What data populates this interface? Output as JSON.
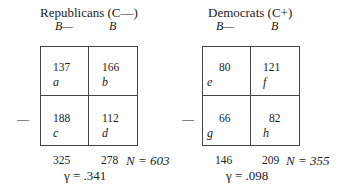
{
  "tables": [
    {
      "title": "Republicans (C—)",
      "col_headers": [
        "B—",
        "B"
      ],
      "row_label_minus": "—",
      "cells": [
        {
          "value": "137",
          "label": "a"
        },
        {
          "value": "166",
          "label": "b"
        },
        {
          "value": "188",
          "label": "c"
        },
        {
          "value": "112",
          "label": "d"
        }
      ],
      "col_totals": [
        "325",
        "278"
      ],
      "n": "N = 603",
      "gamma": "γ = .341"
    },
    {
      "title": "Democrats (C+)",
      "col_headers": [
        "B—",
        "B"
      ],
      "row_label_minus": "—",
      "cells": [
        {
          "value": "80",
          "label": "e"
        },
        {
          "value": "121",
          "label": "f"
        },
        {
          "value": "66",
          "label": "g"
        },
        {
          "value": "82",
          "label": "h"
        }
      ],
      "col_totals": [
        "146",
        "209"
      ],
      "n": "N = 355",
      "gamma": "γ = .098"
    }
  ]
}
